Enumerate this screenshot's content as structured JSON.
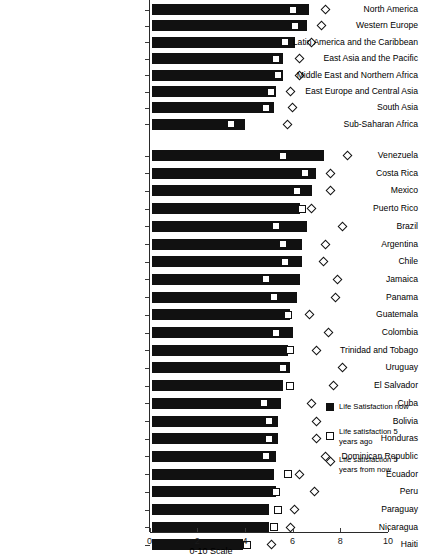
{
  "chart_data": {
    "type": "bar",
    "title": "",
    "xlabel": "0-10 Scale",
    "ylabel": "",
    "xlim": [
      0,
      10
    ],
    "xticks": [
      0,
      2,
      4,
      6,
      8,
      10
    ],
    "grid": false,
    "orientation": "horizontal",
    "legend_position": "right",
    "series": [
      {
        "name": "Life Satisfaction now",
        "marker": "filled-bar"
      },
      {
        "name": "Life satisfaction 5 years ago",
        "marker": "open-square"
      },
      {
        "name": "Life satisfaction 5 years from now",
        "marker": "open-diamond"
      }
    ],
    "groups": [
      {
        "name": "regions",
        "categories": [
          "North America",
          "Western Europe",
          "Latin America and the Caribbean",
          "East Asia and the Pacific",
          "Middle East and Northern Africa",
          "East Europe and Central Asia",
          "South Asia",
          "Sub-Saharan Africa"
        ],
        "now": [
          6.7,
          6.6,
          6.1,
          5.6,
          5.6,
          5.3,
          5.2,
          4.0
        ],
        "five_ago": [
          6.0,
          6.1,
          5.7,
          5.3,
          5.4,
          5.1,
          4.9,
          3.4
        ],
        "five_from_now": [
          7.4,
          7.2,
          6.8,
          6.3,
          6.3,
          5.9,
          6.0,
          5.8
        ]
      },
      {
        "name": "countries",
        "categories": [
          "Venezuela",
          "Costa Rica",
          "Mexico",
          "Puerto Rico",
          "Brazil",
          "Argentina",
          "Chile",
          "Jamaica",
          "Panama",
          "Guatemala",
          "Colombia",
          "Trinidad and Tobago",
          "Uruguay",
          "El Salvador",
          "Cuba",
          "Bolivia",
          "Honduras",
          "Dominican Republic",
          "Ecuador",
          "Peru",
          "Paraguay",
          "Nicaragua",
          "Haiti"
        ],
        "now": [
          7.3,
          7.0,
          6.8,
          6.3,
          6.6,
          6.4,
          6.4,
          6.3,
          6.2,
          5.9,
          6.0,
          5.8,
          5.9,
          5.6,
          5.5,
          5.4,
          5.4,
          5.3,
          5.2,
          5.3,
          5.0,
          5.0,
          3.9
        ],
        "five_ago": [
          5.6,
          6.5,
          6.2,
          6.4,
          5.3,
          5.6,
          5.7,
          4.9,
          5.2,
          5.8,
          5.3,
          5.9,
          5.6,
          5.9,
          4.8,
          5.0,
          5.0,
          4.9,
          5.8,
          5.3,
          5.4,
          5.2,
          4.1
        ],
        "five_from_now": [
          8.3,
          7.6,
          7.6,
          6.8,
          8.1,
          7.4,
          7.3,
          7.9,
          7.8,
          6.7,
          7.5,
          7.0,
          8.1,
          7.7,
          6.8,
          7.0,
          7.0,
          7.4,
          6.3,
          6.9,
          6.1,
          5.9,
          5.1
        ]
      }
    ]
  },
  "axis": {
    "xlabel": "0-10 Scale",
    "tick_labels": [
      "0",
      "2",
      "4",
      "6",
      "8",
      "10"
    ]
  },
  "legend": {
    "items": [
      {
        "label": "Life Satisfaction now",
        "icon": "filled-square-icon"
      },
      {
        "label": "Life satisfaction 5 years ago",
        "icon": "open-square-icon"
      },
      {
        "label": "Life satisfaction 5 years from now",
        "icon": "open-diamond-icon"
      }
    ]
  }
}
